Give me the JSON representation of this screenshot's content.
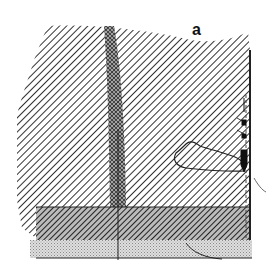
{
  "figure": {
    "panel_label": "a",
    "colors": {
      "background": "#ffffff",
      "hatch": "#333333",
      "dense_band": "#555555",
      "stipple": "#bdbdbd",
      "outline": "#222222"
    },
    "regions": [
      {
        "name": "upper-hatched-region",
        "pattern": "diagonal-hatch"
      },
      {
        "name": "vertical-dense-band",
        "pattern": "cross-hatch"
      },
      {
        "name": "lower-dense-band",
        "pattern": "dense-diagonal-hatch"
      },
      {
        "name": "bottom-stippled-layer",
        "pattern": "stipple"
      },
      {
        "name": "outlined-blob",
        "pattern": "outline"
      },
      {
        "name": "right-edge-markers",
        "pattern": "arrows"
      }
    ]
  }
}
